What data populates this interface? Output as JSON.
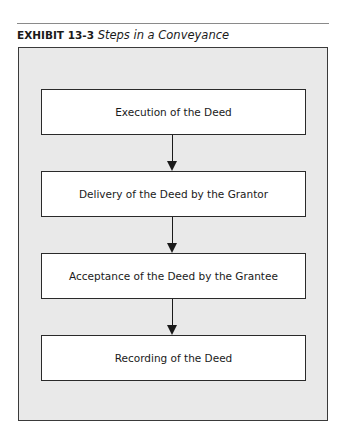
{
  "exhibit": {
    "label": "EXHIBIT 13-3",
    "caption": "Steps in a Conveyance"
  },
  "diagram": {
    "type": "flowchart",
    "direction": "top-to-bottom",
    "steps": [
      {
        "label": "Execution of the Deed"
      },
      {
        "label": "Delivery of the Deed by the Grantor"
      },
      {
        "label": "Acceptance of the Deed by the Grantee"
      },
      {
        "label": "Recording of the Deed"
      }
    ],
    "connectors": [
      {
        "from": 0,
        "to": 1
      },
      {
        "from": 1,
        "to": 2
      },
      {
        "from": 2,
        "to": 3
      }
    ],
    "colors": {
      "panel_background": "#e9e9e9",
      "box_background": "#ffffff",
      "stroke": "#1a1a1a"
    }
  }
}
